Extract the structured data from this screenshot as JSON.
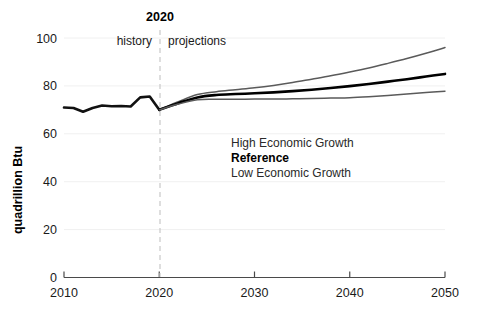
{
  "chart_data": {
    "type": "line",
    "title": "",
    "xlabel": "",
    "ylabel": "quadrillion Btu",
    "xlim": [
      2010,
      2050
    ],
    "ylim": [
      0,
      100
    ],
    "xticks": [
      "2010",
      "2020",
      "2030",
      "2040",
      "2050"
    ],
    "yticks": [
      "0",
      "20",
      "40",
      "60",
      "80",
      "100"
    ],
    "grid": "faint-horizontal",
    "legend_position": "inside-center",
    "divider": {
      "year": "2020",
      "left_label": "history",
      "right_label": "projections"
    },
    "series": [
      {
        "name": "History",
        "color": "#111111",
        "width": 2.6,
        "x": [
          2010,
          2011,
          2012,
          2013,
          2014,
          2015,
          2016,
          2017,
          2018,
          2019,
          2020
        ],
        "values": [
          71.0,
          70.8,
          69.2,
          70.8,
          71.8,
          71.5,
          71.6,
          71.4,
          75.2,
          75.6,
          70.0
        ]
      },
      {
        "name": "High Economic Growth",
        "color": "#5a5a5a",
        "width": 1.5,
        "x": [
          2020,
          2022,
          2024,
          2026,
          2028,
          2030,
          2032,
          2034,
          2036,
          2038,
          2040,
          2042,
          2044,
          2046,
          2048,
          2050
        ],
        "values": [
          70.0,
          73.4,
          76.4,
          77.6,
          78.4,
          79.2,
          80.2,
          81.4,
          82.8,
          84.2,
          85.8,
          87.5,
          89.4,
          91.4,
          93.6,
          96.0
        ]
      },
      {
        "name": "Reference",
        "color": "#000000",
        "width": 2.6,
        "x": [
          2020,
          2022,
          2024,
          2026,
          2028,
          2030,
          2032,
          2034,
          2036,
          2038,
          2040,
          2042,
          2044,
          2046,
          2048,
          2050
        ],
        "values": [
          70.0,
          72.8,
          75.2,
          76.2,
          76.6,
          76.9,
          77.3,
          77.8,
          78.4,
          79.1,
          79.9,
          80.8,
          81.8,
          82.8,
          83.9,
          85.0
        ]
      },
      {
        "name": "Low Economic Growth",
        "color": "#5a5a5a",
        "width": 1.5,
        "x": [
          2020,
          2022,
          2024,
          2026,
          2028,
          2030,
          2032,
          2034,
          2036,
          2038,
          2040,
          2042,
          2044,
          2046,
          2048,
          2050
        ],
        "values": [
          70.0,
          72.4,
          74.2,
          74.4,
          74.4,
          74.5,
          74.5,
          74.6,
          74.7,
          74.9,
          75.1,
          75.5,
          76.0,
          76.6,
          77.2,
          77.8
        ]
      }
    ],
    "legend": [
      {
        "label": "High Economic Growth",
        "bold": false
      },
      {
        "label": "Reference",
        "bold": true
      },
      {
        "label": "Low Economic Growth",
        "bold": false
      }
    ]
  },
  "colors": {
    "axis": "#4a4a4a",
    "grid": "#f0f0f0",
    "divider": "#c8c8c8",
    "text": "#1a1a1a"
  }
}
